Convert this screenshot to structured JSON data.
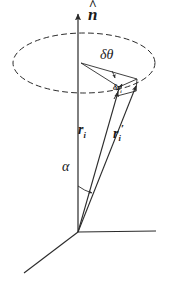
{
  "figure": {
    "background_color": "#ffffff",
    "stroke_color": "#2b2b2b",
    "labels": {
      "axis_normal": "n",
      "axis_normal_hat": "^",
      "rotation_angle": "δθ",
      "displacement": "δr",
      "displacement_sub": "i",
      "position_vector": "r",
      "position_vector_sub": "i",
      "position_vector_primed": "r",
      "position_vector_primed_sub": "i",
      "position_vector_primed_mark": "′",
      "polar_angle": "α"
    },
    "geometry": {
      "origin_x": 78,
      "origin_y": 232,
      "axis_vertical_top_y": 10,
      "axis_horizontal_right_x": 155,
      "axis_diagonal_end_x": 24,
      "axis_diagonal_end_y": 273,
      "ellipse_center_x": 84,
      "ellipse_center_y": 63,
      "ellipse_rx": 71,
      "ellipse_ry": 30,
      "cone_apex_x": 81,
      "cone_apex_y": 63,
      "tip_ri_x": 119,
      "tip_ri_y": 86,
      "tip_ri_prime_x": 137,
      "tip_ri_prime_y": 79
    }
  }
}
